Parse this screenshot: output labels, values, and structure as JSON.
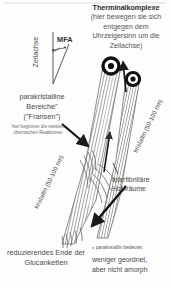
{
  "diagram": {
    "title": "Therminalkomplexe",
    "subtitle": "(hier bewegen sie sich entgegen dem Uhrzeigersinn um die Zellachse)",
    "mfa_label": "MFA",
    "cell_axis_label": "Zellachse",
    "paracrystalline": {
      "line1": "parakristalline",
      "line2": "Bereiche\"",
      "line3": "(\"Fransen\")",
      "small": "hier beginnen die meisten chemischen Reaktionen"
    },
    "crystalline_left": "kristallin (50-100 nm)",
    "crystalline_right": "kristallin (50-100 nm)",
    "interfibrillar": "interfibrilläre Hohlräume",
    "reducing_end": "reduzierendes Ende der Glucanketten",
    "footnote": {
      "star": "*",
      "small": "parakristallin bedeutet:",
      "line1": "weniger geordnet,",
      "line2": "aber nicht amorph"
    }
  },
  "colors": {
    "background": "#fdfdfd",
    "text": "#4a4a4a",
    "title": "#2e2e2e",
    "stroke": "#3a3a3a",
    "fibril": "#8c8c8c"
  }
}
